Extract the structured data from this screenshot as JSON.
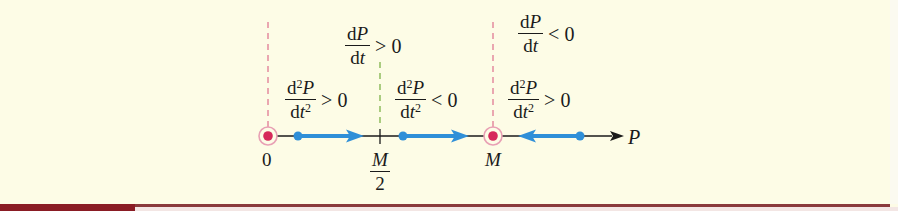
{
  "diagram": {
    "type": "phase-line",
    "axis_label": "P",
    "points": [
      {
        "label": "0",
        "role": "equilibrium",
        "x": 268
      },
      {
        "label_num": "M",
        "label_den": "2",
        "role": "inflection",
        "x": 380
      },
      {
        "label": "M",
        "role": "equilibrium",
        "x": 493
      }
    ],
    "regions": [
      {
        "interval": "0 < P < M",
        "first_derivative": {
          "num_d": "d",
          "num_var": "P",
          "den": "dt",
          "relation": "> 0"
        }
      },
      {
        "interval": "P > M",
        "first_derivative": {
          "num_d": "d",
          "num_var": "P",
          "den": "dt",
          "relation": "< 0"
        }
      }
    ],
    "subregions": [
      {
        "interval": "0 < P < M/2",
        "second_derivative": {
          "num_d": "d",
          "num_exp": "2",
          "num_var": "P",
          "den_d": "d",
          "den_var": "t",
          "den_exp": "2",
          "relation": "> 0"
        },
        "arrow_direction": "right"
      },
      {
        "interval": "M/2 < P < M",
        "second_derivative": {
          "num_d": "d",
          "num_exp": "2",
          "num_var": "P",
          "den_d": "d",
          "den_var": "t",
          "den_exp": "2",
          "relation": "< 0"
        },
        "arrow_direction": "right"
      },
      {
        "interval": "P > M",
        "second_derivative": {
          "num_d": "d",
          "num_exp": "2",
          "num_var": "P",
          "den_d": "d",
          "den_var": "t",
          "den_exp": "2",
          "relation": "> 0"
        },
        "arrow_direction": "left"
      }
    ],
    "colors": {
      "background": "#fdfce6",
      "axis": "#1a1a1a",
      "flow_arrow": "#2f8fd8",
      "equilibrium_dot": "#d6285a",
      "equilibrium_ring": "#e8a0b4",
      "equilibrium_dashes": "#e07a94",
      "inflection_dashes": "#7fb24a",
      "bottom_bar": "#8a1c24"
    }
  }
}
